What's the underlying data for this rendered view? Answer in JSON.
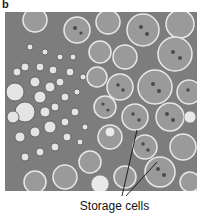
{
  "figure": {
    "panel_label": "b",
    "image_description": "Light micrograph cross-section of plant root tissue: vascular region of small cells at left, large storage parenchyma cells filled with granules at right",
    "annotation": {
      "label": "Storage cells",
      "pointer_count": 2
    },
    "colors": {
      "background": "#ffffff",
      "tissue_dark": "#5e5e5e",
      "tissue_mid": "#8a8a8a",
      "cell_lumen": "#e6e6e6",
      "leader_line": "#111111"
    }
  }
}
